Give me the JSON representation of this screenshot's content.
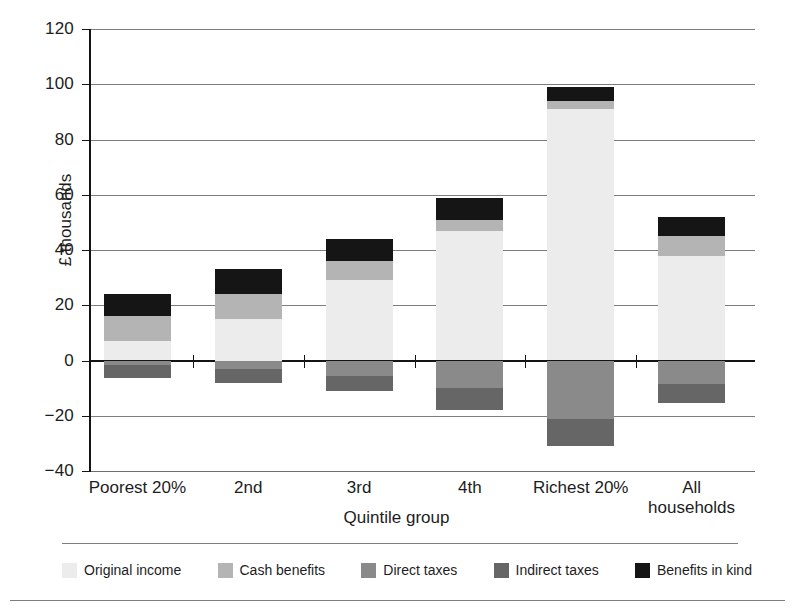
{
  "chart_data": {
    "type": "bar",
    "subtype": "stacked-bar-diverging",
    "title": "",
    "xlabel": "Quintile group",
    "ylabel": "£ thousands",
    "ylim": [
      -40,
      120
    ],
    "ytick_values": [
      120,
      100,
      80,
      60,
      40,
      20,
      0,
      -20,
      -40
    ],
    "ytick_labels": [
      "120",
      "100",
      "80",
      "60",
      "40",
      "20",
      "0",
      "−20",
      "−40"
    ],
    "grid": true,
    "legend_position": "bottom",
    "categories": [
      "Poorest 20%",
      "2nd",
      "3rd",
      "4th",
      "Richest 20%",
      "All\nhouseholds"
    ],
    "series": [
      {
        "name": "Original income",
        "color": "#ececed",
        "values": [
          7,
          15,
          29,
          47,
          91,
          38
        ]
      },
      {
        "name": "Cash benefits",
        "color": "#b4b4b4",
        "values": [
          9,
          9,
          7,
          4,
          3,
          7
        ]
      },
      {
        "name": "Direct taxes",
        "color": "#8a8a8a",
        "values": [
          -1.5,
          -3,
          -5.5,
          -10,
          -21,
          -8.5
        ]
      },
      {
        "name": "Indirect taxes",
        "color": "#666666",
        "values": [
          -5,
          -5,
          -5.5,
          -8,
          -10,
          -7
        ]
      },
      {
        "name": "Benefits in kind",
        "color": "#151515",
        "values": [
          8,
          9,
          8,
          8,
          5,
          7
        ]
      }
    ],
    "bar_tops": [
      24,
      33,
      44,
      59,
      99,
      52
    ],
    "bar_bottoms": [
      -6.5,
      -8,
      -11,
      -18,
      -31,
      -15.5
    ]
  },
  "legend": {
    "items": [
      {
        "label": "Original income",
        "color": "#ececed"
      },
      {
        "label": "Cash benefits",
        "color": "#b4b4b4"
      },
      {
        "label": "Direct taxes",
        "color": "#8a8a8a"
      },
      {
        "label": "Indirect taxes",
        "color": "#666666"
      },
      {
        "label": "Benefits in kind",
        "color": "#151515"
      }
    ]
  },
  "axes": {
    "y_title": "£ thousands",
    "x_title": "Quintile group"
  }
}
